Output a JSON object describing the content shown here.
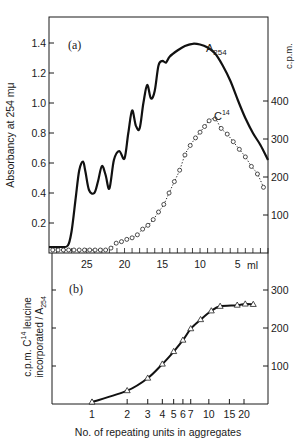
{
  "chart_data": [
    {
      "id": "a",
      "type": "line",
      "panel_label": "(a)",
      "title": "",
      "xlabel": "ml",
      "x_reversed": true,
      "x_ticks": [
        25,
        20,
        15,
        10,
        5
      ],
      "x_tick_labels": [
        "25",
        "20",
        "15",
        "10",
        "5"
      ],
      "x_unit_label": "ml",
      "xlim": [
        30,
        1
      ],
      "ylabel_left": "Absorbancy at 254 mμ",
      "ylim_left": [
        0,
        1.6
      ],
      "y_ticks_left": [
        0.2,
        0.4,
        0.6,
        0.8,
        1.0,
        1.2,
        1.4
      ],
      "y_tick_labels_left": [
        "0.2",
        "0.4",
        "0.6",
        "0.8",
        "1.0",
        "1.2",
        "1.4"
      ],
      "ylabel_right": "c.p.m.",
      "ylim_right": [
        0,
        600
      ],
      "y_ticks_right": [
        100,
        200,
        300,
        400
      ],
      "y_tick_labels_right": [
        "100",
        "200",
        "300",
        "400"
      ],
      "grid": false,
      "series": [
        {
          "name": "A254",
          "label_main": "A",
          "label_sub": "254",
          "axis": "left",
          "style": "solid",
          "x": [
            30,
            28.5,
            27.5,
            27.0,
            26.5,
            26.0,
            25.5,
            25.2,
            24.7,
            24.0,
            23.5,
            23.0,
            22.5,
            22.0,
            21.4,
            20.7,
            20.0,
            19.5,
            19.0,
            18.5,
            18.0,
            17.5,
            17.0,
            16.5,
            16.0,
            15.5,
            15.0,
            14.5,
            14.0,
            13.0,
            12.0,
            11.0,
            10.0,
            9.0,
            8.0,
            7.0,
            6.0,
            5.0,
            4.0,
            3.0,
            2.0,
            1.0
          ],
          "values": [
            0.04,
            0.04,
            0.05,
            0.15,
            0.35,
            0.55,
            0.61,
            0.55,
            0.42,
            0.4,
            0.48,
            0.58,
            0.52,
            0.43,
            0.62,
            0.68,
            0.63,
            0.8,
            0.95,
            0.85,
            0.83,
            1.0,
            1.12,
            1.03,
            1.08,
            1.25,
            1.28,
            1.27,
            1.31,
            1.35,
            1.38,
            1.395,
            1.39,
            1.37,
            1.33,
            1.25,
            1.15,
            1.02,
            0.9,
            0.8,
            0.72,
            0.62
          ]
        },
        {
          "name": "C14",
          "label_main": "C",
          "label_sup": "14",
          "axis": "right",
          "style": "dotted-circles",
          "x": [
            29.5,
            28.8,
            28.1,
            27.4,
            26.7,
            26.0,
            25.3,
            24.6,
            23.9,
            23.2,
            22.5,
            21.8,
            21.1,
            20.4,
            19.7,
            19.0,
            18.3,
            17.6,
            16.9,
            16.2,
            15.5,
            14.8,
            14.1,
            13.4,
            12.7,
            12.0,
            11.3,
            10.6,
            10.0,
            9.4,
            8.8,
            8.0,
            7.2,
            6.4,
            5.6,
            4.8,
            4.0,
            3.2,
            2.4,
            1.6
          ],
          "values": [
            0,
            0,
            0,
            0,
            0,
            0,
            0,
            0,
            0,
            0,
            0,
            5,
            18,
            22,
            28,
            32,
            40,
            55,
            65,
            80,
            100,
            120,
            150,
            180,
            210,
            250,
            275,
            295,
            310,
            325,
            340,
            345,
            320,
            305,
            285,
            265,
            245,
            220,
            200,
            165
          ]
        }
      ],
      "annotations": [
        "(a)",
        "A254",
        "C14"
      ]
    },
    {
      "id": "b",
      "type": "line",
      "panel_label": "(b)",
      "title": "",
      "xlabel": "No. of repeating units in aggregates",
      "x_scale": "log",
      "x_ticks": [
        1,
        2,
        3,
        4,
        5,
        6,
        7,
        10,
        15,
        20
      ],
      "x_tick_labels": [
        "1",
        "2",
        "3",
        "4",
        "5",
        "6",
        "7",
        "10",
        "15",
        "20"
      ],
      "xlim": [
        0.5,
        25
      ],
      "ylabel_line1": "c.p.m. C14 leucine",
      "ylabel_line2": "incorporated / A254",
      "ylabel": "c.p.m. C14 leucine incorporated / A254",
      "ylim": [
        0,
        350
      ],
      "y_ticks_right": [
        100,
        200,
        300
      ],
      "y_tick_labels_right": [
        "100",
        "200",
        "300"
      ],
      "grid": false,
      "series": [
        {
          "name": "c.p.m. C14 leucine incorporated / A254",
          "marker": "triangle",
          "style": "solid",
          "x": [
            1,
            2,
            3,
            4,
            5,
            6,
            7,
            8.5,
            10.5,
            12.5,
            17.5,
            20.5,
            24
          ],
          "values": [
            5,
            35,
            68,
            105,
            138,
            168,
            198,
            222,
            245,
            257,
            260,
            263,
            262
          ]
        }
      ],
      "annotations": [
        "(b)"
      ]
    }
  ]
}
